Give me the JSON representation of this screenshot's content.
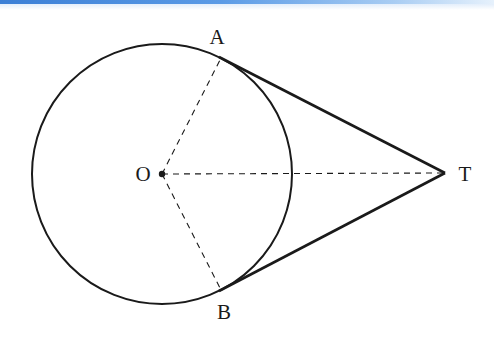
{
  "diagram": {
    "type": "geometry",
    "circle": {
      "center_label": "O",
      "cx": 162,
      "cy": 174,
      "r": 130
    },
    "points": {
      "O": {
        "label": "O",
        "x": 162,
        "y": 174
      },
      "A": {
        "label": "A",
        "x": 221,
        "y": 58
      },
      "B": {
        "label": "B",
        "x": 221,
        "y": 290
      },
      "T": {
        "label": "T",
        "x": 445,
        "y": 173
      }
    },
    "segments": [
      {
        "from": "A",
        "to": "T",
        "style": "solid"
      },
      {
        "from": "B",
        "to": "T",
        "style": "solid"
      },
      {
        "from": "O",
        "to": "A",
        "style": "dashed"
      },
      {
        "from": "O",
        "to": "B",
        "style": "dashed"
      },
      {
        "from": "O",
        "to": "T",
        "style": "dashed"
      }
    ],
    "colors": {
      "stroke": "#1a1a1a",
      "accent_bar": "#3b7fd6"
    }
  }
}
